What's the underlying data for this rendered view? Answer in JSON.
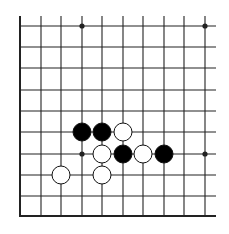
{
  "diagram": {
    "line_color": "#222222",
    "background": "#ffffff",
    "columns_x": [
      20,
      41,
      61,
      82,
      102,
      123,
      143,
      164,
      184,
      205
    ],
    "rows_y": [
      26,
      47,
      68,
      90,
      111,
      132,
      154,
      175,
      196
    ],
    "edge_bottom_y": 216,
    "edge_left_x": 20,
    "top_extend_y": 16,
    "right_extend_x": 216,
    "star_points": [
      {
        "x": 82,
        "y": 26
      },
      {
        "x": 205,
        "y": 26
      },
      {
        "x": 82,
        "y": 154
      },
      {
        "x": 205,
        "y": 154
      }
    ],
    "stones": [
      {
        "color": "black",
        "x": 82,
        "y": 132
      },
      {
        "color": "black",
        "x": 102,
        "y": 132
      },
      {
        "color": "white",
        "x": 123,
        "y": 132
      },
      {
        "color": "white",
        "x": 102,
        "y": 154
      },
      {
        "color": "black",
        "x": 123,
        "y": 154
      },
      {
        "color": "white",
        "x": 143,
        "y": 154
      },
      {
        "color": "black",
        "x": 164,
        "y": 154
      },
      {
        "color": "white",
        "x": 61,
        "y": 175
      },
      {
        "color": "white",
        "x": 102,
        "y": 175
      }
    ],
    "stone_radius": 9
  }
}
